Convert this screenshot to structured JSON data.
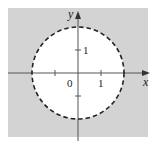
{
  "diagram": {
    "type": "region-plot",
    "axes": {
      "x_label": "x",
      "y_label": "y",
      "origin_label": "0",
      "x_tick_label": "1",
      "y_tick_label": "1"
    },
    "circle": {
      "center": [
        0,
        0
      ],
      "radius": 2,
      "boundary_style": "dashed"
    },
    "colors": {
      "shaded": "#d3d3d3",
      "unshaded": "#ffffff",
      "axis": "#555555",
      "boundary": "#222222"
    }
  }
}
